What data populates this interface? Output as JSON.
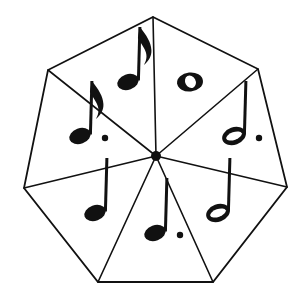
{
  "figure": {
    "shape": "heptagon",
    "sector_count": 7,
    "line_color": "#111111",
    "fill_color": "#ffffff",
    "background_color": "#ffffff",
    "stroke_width": 1.6,
    "center": {
      "x": 156,
      "y": 156
    },
    "hub_radius": 5
  },
  "polygon": {
    "name": "heptagon-outline",
    "vertices": [
      {
        "label": "top",
        "x": 153,
        "y": 17
      },
      {
        "label": "upper-right",
        "x": 258,
        "y": 69
      },
      {
        "label": "right",
        "x": 287,
        "y": 187
      },
      {
        "label": "lower-right",
        "x": 213,
        "y": 282
      },
      {
        "label": "lower-left",
        "x": 98,
        "y": 282
      },
      {
        "label": "left",
        "x": 24,
        "y": 188
      },
      {
        "label": "upper-left",
        "x": 48,
        "y": 70
      }
    ],
    "points_attr": "153,17 258,69 287,187 213,282 98,282 24,188 48,70"
  },
  "spokes": [
    {
      "name": "spoke-to-top",
      "x2": 153,
      "y2": 17
    },
    {
      "name": "spoke-to-upper-right",
      "x2": 258,
      "y2": 69
    },
    {
      "name": "spoke-to-right",
      "x2": 287,
      "y2": 187
    },
    {
      "name": "spoke-to-lower-right",
      "x2": 213,
      "y2": 282
    },
    {
      "name": "spoke-to-lower-left",
      "x2": 98,
      "y2": 282
    },
    {
      "name": "spoke-to-left",
      "x2": 24,
      "y2": 188
    },
    {
      "name": "spoke-to-upper-left",
      "x2": 48,
      "y2": 70
    }
  ],
  "sectors": [
    {
      "id": "sector-top-left",
      "position": "top-left",
      "note_name": "eighth-note",
      "note_label": "Eighth note",
      "note_alt_label": "Quaver",
      "beat_value": "1/2",
      "notehead": "filled",
      "stem": "up",
      "flags": 1,
      "dotted": false,
      "glyph": "♪",
      "cx": 128,
      "cy": 82
    },
    {
      "id": "sector-top-right",
      "position": "top-right",
      "note_name": "whole-note",
      "note_label": "Whole note",
      "note_alt_label": "Semibreve",
      "beat_value": "4",
      "notehead": "open",
      "stem": "none",
      "flags": 0,
      "dotted": false,
      "glyph": "𝅝",
      "cx": 190,
      "cy": 82
    },
    {
      "id": "sector-right",
      "position": "right",
      "note_name": "dotted-half-note",
      "note_label": "Dotted half note",
      "note_alt_label": "Dotted minim",
      "beat_value": "3",
      "notehead": "open",
      "stem": "up",
      "flags": 0,
      "dotted": true,
      "glyph": "𝅗𝅥",
      "cx": 234,
      "cy": 136
    },
    {
      "id": "sector-lower-right",
      "position": "lower-right",
      "note_name": "half-note",
      "note_label": "Half note",
      "note_alt_label": "Minim",
      "beat_value": "2",
      "notehead": "open",
      "stem": "up",
      "flags": 0,
      "dotted": false,
      "glyph": "𝅗𝅥",
      "cx": 218,
      "cy": 213
    },
    {
      "id": "sector-bottom",
      "position": "bottom",
      "note_name": "dotted-quarter-note",
      "note_label": "Dotted quarter note",
      "note_alt_label": "Dotted crotchet",
      "beat_value": "1 1/2",
      "notehead": "filled",
      "stem": "up",
      "flags": 0,
      "dotted": true,
      "glyph": "𝅘𝅥",
      "cx": 155,
      "cy": 233
    },
    {
      "id": "sector-lower-left",
      "position": "lower-left",
      "note_name": "quarter-note",
      "note_label": "Quarter note",
      "note_alt_label": "Crotchet",
      "beat_value": "1",
      "notehead": "filled",
      "stem": "up",
      "flags": 0,
      "dotted": false,
      "glyph": "♩",
      "cx": 95,
      "cy": 213
    },
    {
      "id": "sector-left",
      "position": "left",
      "note_name": "dotted-eighth-note",
      "note_label": "Dotted eighth note",
      "note_alt_label": "Dotted quaver",
      "beat_value": "3/4",
      "notehead": "filled",
      "stem": "up",
      "flags": 1,
      "dotted": true,
      "glyph": "♪",
      "cx": 80,
      "cy": 136
    }
  ]
}
